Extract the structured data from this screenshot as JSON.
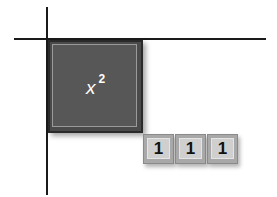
{
  "diagram": {
    "type": "algebra-tiles",
    "x_squared_tile": {
      "base": "x",
      "exponent": "2",
      "color": "#4a4a4a"
    },
    "unit_tiles": [
      {
        "label": "1"
      },
      {
        "label": "1"
      },
      {
        "label": "1"
      }
    ],
    "unit_tile_color": "#a8a8a8"
  }
}
